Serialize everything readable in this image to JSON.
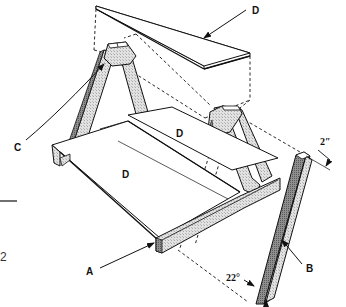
{
  "diagram": {
    "type": "exploded assembly drawing",
    "labels": {
      "top_board": "D",
      "seat_board_back": "D",
      "seat_board_front": "D",
      "frame_leg_left": "C",
      "base_rail": "A",
      "loose_leg": "B",
      "leg_foot": "A"
    },
    "dimensions": {
      "leg_width": "2″",
      "leg_angle": "22°"
    },
    "margin_text": {
      "page_fragment": "2"
    },
    "colors": {
      "line": "#1a1a1a",
      "hatch_light": "#d6d6d6",
      "hatch_dark": "#9a9a9a",
      "paper": "#ffffff"
    }
  }
}
